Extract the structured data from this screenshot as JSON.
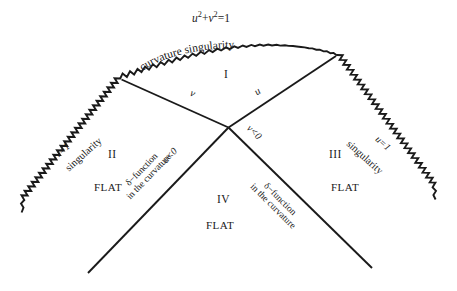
{
  "figure": {
    "type": "spacetime-conformal-diagram",
    "background_color": "#ffffff",
    "line_color": "#1a1a1a",
    "top_equation_plain": "u^2 + v^2 = 1",
    "top_equation": {
      "u": "u",
      "u_exp": "2",
      "plus": "+",
      "v": "v",
      "v_exp": "2",
      "equals": "=1"
    },
    "arc_label": {
      "text": "curvature singularity",
      "chars": [
        "c",
        "u",
        "r",
        "v",
        "a",
        "t",
        "u",
        "r",
        "e",
        " ",
        "s",
        "i",
        "n",
        "g",
        "u",
        "l",
        "a",
        "r",
        "i",
        "t",
        "y"
      ]
    },
    "left_edge": {
      "coordinate_label": "v=1",
      "singularity_label": "singularity"
    },
    "right_edge": {
      "coordinate_label": "u=1",
      "singularity_label": "singularity"
    },
    "null_axes": {
      "upper_left": "v",
      "upper_right": "u",
      "lower_left": "u<0",
      "lower_right": "v<0"
    },
    "regions": [
      {
        "name": "I",
        "label": "I",
        "flat": ""
      },
      {
        "name": "II",
        "label": "II",
        "flat": "FLAT"
      },
      {
        "name": "III",
        "label": "III",
        "flat": "FLAT"
      },
      {
        "name": "IV",
        "label": "IV",
        "flat": "FLAT"
      }
    ],
    "delta_left": {
      "line1": "δ−function",
      "line2": "in the curvature"
    },
    "delta_right": {
      "line1": "δ−function",
      "line2": "in the curvature"
    }
  }
}
